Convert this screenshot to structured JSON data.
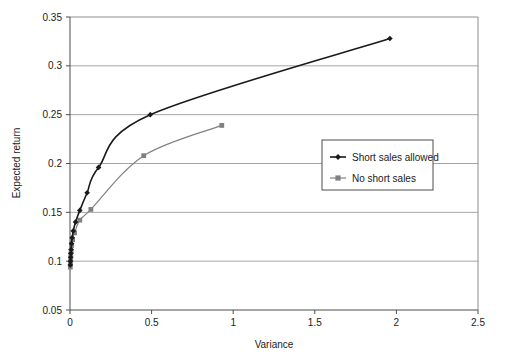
{
  "chart_data": {
    "type": "line",
    "title": "",
    "xlabel": "Variance",
    "ylabel": "Expected return",
    "xlim": [
      0,
      2.5
    ],
    "ylim": [
      0.05,
      0.35
    ],
    "xticks": [
      "0",
      "0.5",
      "1",
      "1.5",
      "2",
      "2.5"
    ],
    "xtick_values": [
      0,
      0.5,
      1,
      1.5,
      2,
      2.5
    ],
    "yticks": [
      "0.05",
      "0.1",
      "0.15",
      "0.2",
      "0.25",
      "0.3",
      "0.35"
    ],
    "ytick_values": [
      0.05,
      0.1,
      0.15,
      0.2,
      0.25,
      0.3,
      0.35
    ],
    "grid": "horizontal",
    "legend_position": "center-right",
    "series": [
      {
        "name": "Short sales allowed",
        "color": "#1a1a1a",
        "marker": "diamond",
        "points": [
          [
            0.002,
            0.096
          ],
          [
            0.003,
            0.1
          ],
          [
            0.004,
            0.104
          ],
          [
            0.005,
            0.108
          ],
          [
            0.007,
            0.112
          ],
          [
            0.009,
            0.118
          ],
          [
            0.013,
            0.124
          ],
          [
            0.02,
            0.131
          ],
          [
            0.034,
            0.14
          ],
          [
            0.06,
            0.152
          ],
          [
            0.105,
            0.17
          ],
          [
            0.175,
            0.196
          ],
          [
            0.492,
            0.25
          ],
          [
            1.96,
            0.328
          ]
        ]
      },
      {
        "name": "No short sales",
        "color": "#808080",
        "marker": "square",
        "points": [
          [
            0.002,
            0.094
          ],
          [
            0.003,
            0.098
          ],
          [
            0.004,
            0.102
          ],
          [
            0.005,
            0.106
          ],
          [
            0.007,
            0.11
          ],
          [
            0.01,
            0.116
          ],
          [
            0.016,
            0.122
          ],
          [
            0.028,
            0.129
          ],
          [
            0.06,
            0.142
          ],
          [
            0.128,
            0.153
          ],
          [
            0.452,
            0.208
          ],
          [
            0.93,
            0.239
          ]
        ]
      }
    ]
  },
  "legend": {
    "items": [
      {
        "label": "Short sales allowed",
        "marker": "diamond-icon",
        "color": "#1a1a1a"
      },
      {
        "label": "No short sales",
        "marker": "square-icon",
        "color": "#808080"
      }
    ]
  }
}
